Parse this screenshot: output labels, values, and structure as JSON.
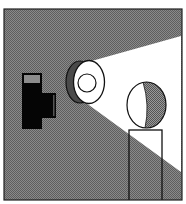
{
  "illustration": {
    "subject": "projector-light-beam-on-figure",
    "canvas": {
      "width": 186,
      "height": 204
    },
    "frame": {
      "x": 4,
      "y": 9,
      "width": 178,
      "height": 191
    },
    "colors": {
      "page": "#ffffff",
      "background_dither_light": "#8a8a8a",
      "background_dither_dark": "#5e5e5e",
      "beam": "#ffffff",
      "outline": "#111111",
      "camera_body": "#050505",
      "camera_top_inset": "#8c8c8c",
      "lens_crescent": "#4a4a4a",
      "head_shadow_light": "#9a9a9a",
      "head_shadow_dark": "#555555"
    },
    "beam": {
      "points": "82,100 88,62 181,36 181,172"
    },
    "projector": {
      "body": {
        "x": 22,
        "y": 73,
        "width": 20,
        "height": 56
      },
      "top_inset": {
        "x": 24,
        "y": 75,
        "width": 16,
        "height": 8
      },
      "side_block": {
        "x": 42,
        "y": 93,
        "width": 14,
        "height": 25
      },
      "lens_back": {
        "cx": 80,
        "cy": 82,
        "rx": 14,
        "ry": 21
      },
      "lens_front": {
        "cx": 89,
        "cy": 82,
        "rx": 15.5,
        "ry": 21.5
      },
      "lens_inner": {
        "cx": 87,
        "cy": 83,
        "r": 9
      }
    },
    "figure": {
      "head": {
        "cx": 146.5,
        "cy": 105,
        "rx": 19.5,
        "ry": 23
      },
      "head_terminator": "M143,82 Q150,105 145,128",
      "body": {
        "x": 129,
        "y": 130,
        "width": 33,
        "height": 70
      }
    }
  }
}
